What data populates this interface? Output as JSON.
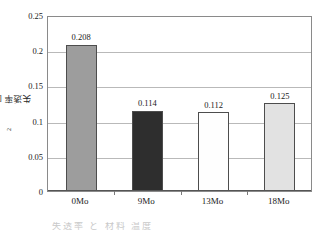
{
  "chart_data": {
    "type": "bar",
    "title": "",
    "xlabel": "",
    "ylabel": "失透率 [g/(h・m2)]",
    "ylabel_main": "失透率 [g/(h・m",
    "ylabel_exponent": "2",
    "ylabel_tail": ")]",
    "categories": [
      "0Mo",
      "9Mo",
      "13Mo",
      "18Mo"
    ],
    "values": [
      0.208,
      0.114,
      0.112,
      0.125
    ],
    "value_labels": [
      "0.208",
      "0.114",
      "0.112",
      "0.125"
    ],
    "ylim": [
      0,
      0.25
    ],
    "ytick_values": [
      0,
      0.05,
      0.1,
      0.15,
      0.2,
      0.25
    ],
    "ytick_labels": [
      "0",
      "0.05",
      "0.1",
      "0.15",
      "0.2",
      "0.25"
    ],
    "grid": true,
    "legend": "none",
    "bar_colors": [
      "#9d9d9d",
      "#2e2e2e",
      "#fefefe",
      "#e2e2e2"
    ],
    "bar_border_color": "#4d4d4d",
    "frame_color": "#8a8a8a",
    "gridline_color": "#b9b9b9"
  },
  "caption": {
    "text": "失透率 と 材料 温度"
  }
}
